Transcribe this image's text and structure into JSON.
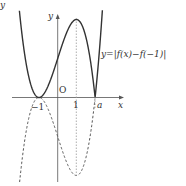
{
  "figure": {
    "corner_label": "y",
    "axis_labels": {
      "x": "x",
      "y": "y"
    },
    "origin_label": "O",
    "ticks": {
      "neg_one": "−1",
      "one": "1",
      "a": "a"
    },
    "curve_label": "y=|f(x)−f(−1)|",
    "colors": {
      "curve": "#333333",
      "dashed": "#555555",
      "axis": "#555555",
      "guide": "#999999"
    }
  },
  "chart_data": {
    "type": "line",
    "title": "",
    "xlabel": "x",
    "ylabel": "y",
    "series": [
      {
        "name": "y=|f(x)−f(−1)|",
        "style": "solid",
        "description": "absolute value of cubic with double root at x=−1 and simple root at x=a; local max at x=1"
      },
      {
        "name": "y=f(x)−f(−1)",
        "style": "dashed",
        "description": "reflected negative portion, local min at x=1"
      }
    ],
    "key_points": {
      "double_root": -1,
      "extremum_x": 1,
      "simple_root": "a"
    },
    "annotations": [
      "O",
      "−1",
      "1",
      "a",
      "y=|f(x)−f(−1)|"
    ]
  }
}
